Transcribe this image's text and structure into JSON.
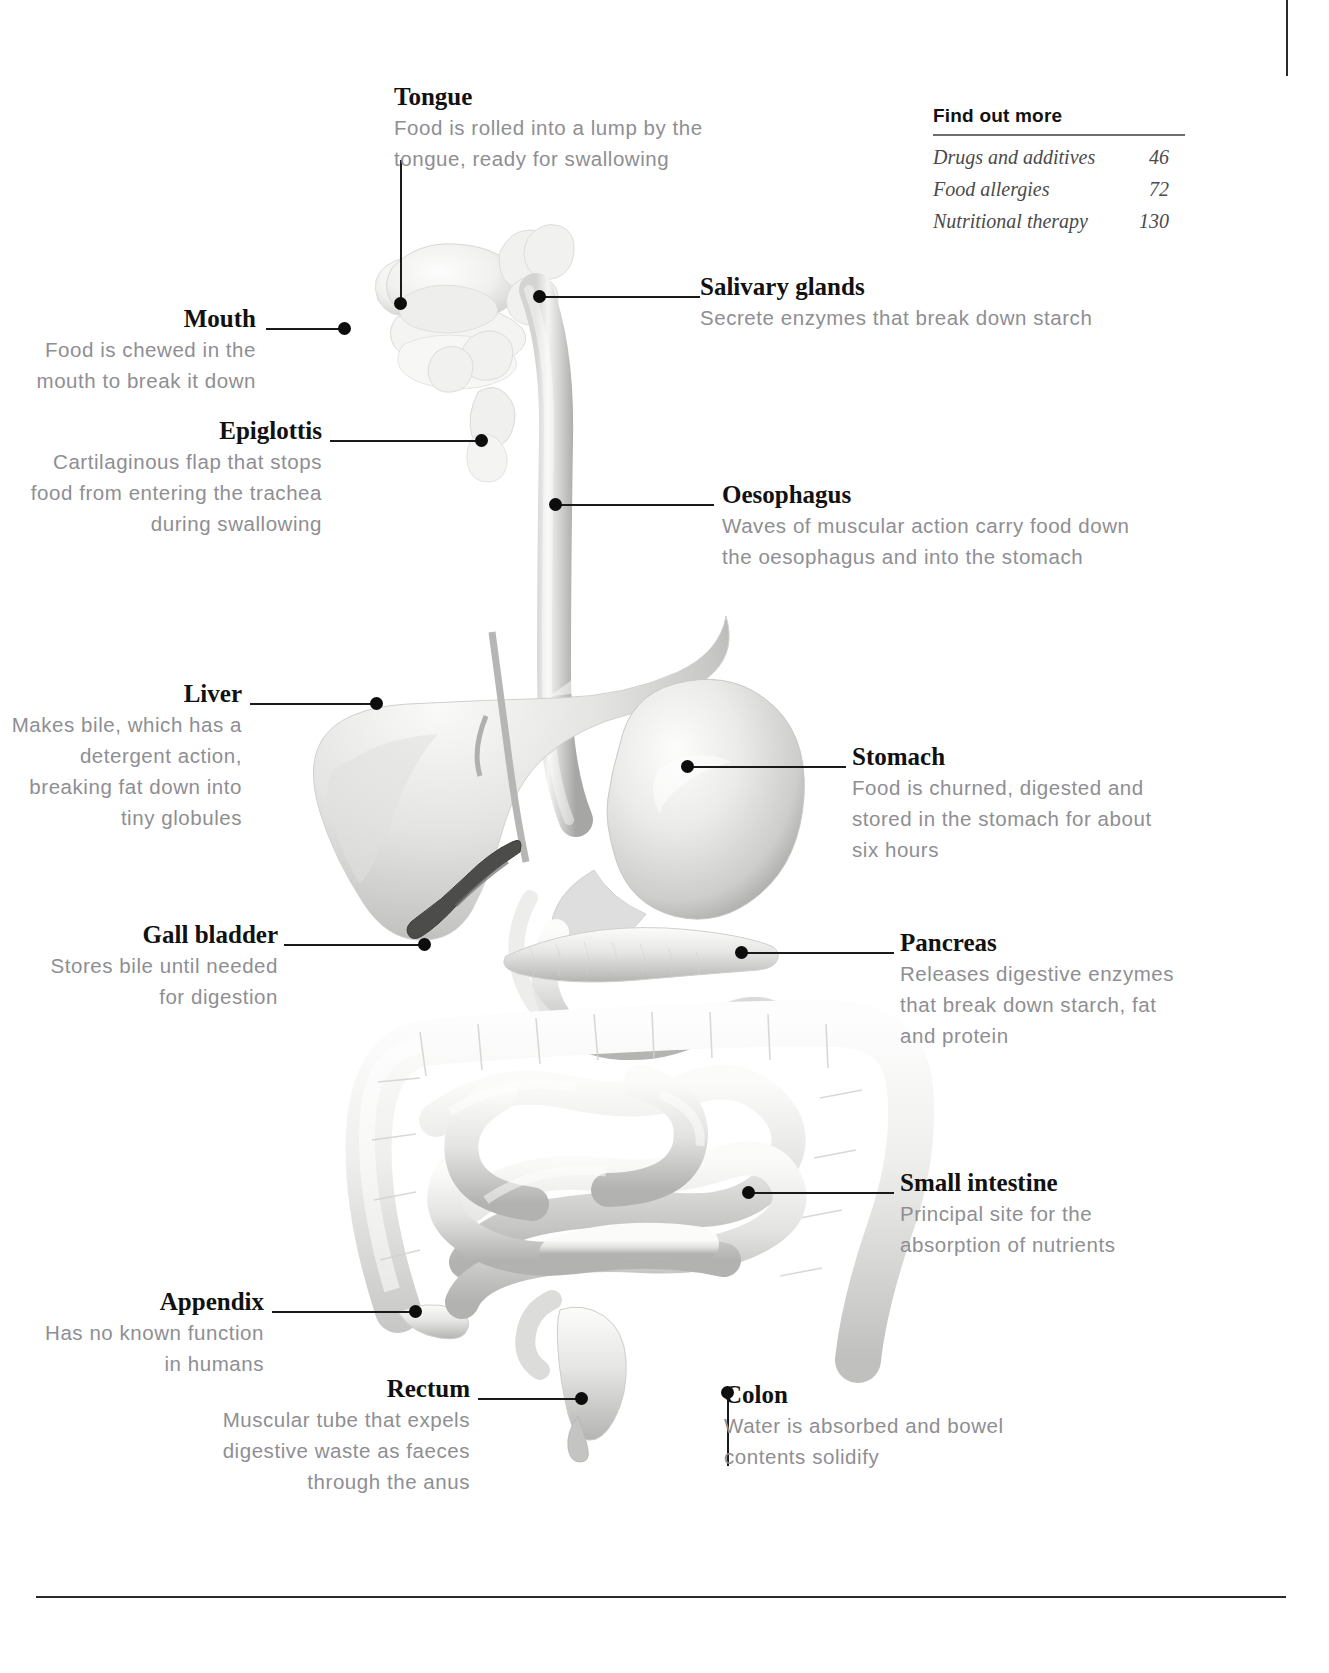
{
  "page": {
    "find_out_more": {
      "heading": "Find out more",
      "entries": [
        {
          "label": "Drugs and additives",
          "page": "46"
        },
        {
          "label": "Food allergies",
          "page": "72"
        },
        {
          "label": "Nutritional therapy",
          "page": "130"
        }
      ]
    }
  },
  "callouts": {
    "tongue": {
      "title": "Tongue",
      "body": "Food is rolled into a lump by the\ntongue, ready for swallowing"
    },
    "mouth": {
      "title": "Mouth",
      "body": "Food is chewed in the\nmouth to break it down"
    },
    "salivary_glands": {
      "title": "Salivary glands",
      "body": "Secrete enzymes that break down starch"
    },
    "epiglottis": {
      "title": "Epiglottis",
      "body": "Cartilaginous flap that stops\nfood from entering the trachea\nduring swallowing"
    },
    "oesophagus": {
      "title": "Oesophagus",
      "body": "Waves of muscular action carry food down\nthe oesophagus and into the stomach"
    },
    "liver": {
      "title": "Liver",
      "body": "Makes bile, which has a\ndetergent action,\nbreaking fat down into\ntiny globules"
    },
    "stomach": {
      "title": "Stomach",
      "body": "Food is churned, digested and\nstored in the stomach for about\nsix hours"
    },
    "gall_bladder": {
      "title": "Gall bladder",
      "body": "Stores bile until needed\nfor digestion"
    },
    "pancreas": {
      "title": "Pancreas",
      "body": "Releases digestive enzymes\nthat break down starch, fat\nand protein"
    },
    "small_intestine": {
      "title": "Small intestine",
      "body": "Principal site for the\nabsorption of nutrients"
    },
    "appendix": {
      "title": "Appendix",
      "body": "Has no known function\nin humans"
    },
    "rectum": {
      "title": "Rectum",
      "body": "Muscular tube that expels\ndigestive waste as faeces\nthrough the anus"
    },
    "colon": {
      "title": "Colon",
      "body": "Water is absorbed and bowel\ncontents solidify"
    }
  },
  "colors": {
    "heading_text": "#111111",
    "body_text": "#8e8e93",
    "leader_line": "#1a1a1a",
    "rule": "#2b2b2b",
    "organ_light": "#f2f2f0",
    "organ_mid": "#d8d8d6",
    "organ_dark": "#8c8c8a",
    "gall_bladder": "#4a4a48"
  }
}
